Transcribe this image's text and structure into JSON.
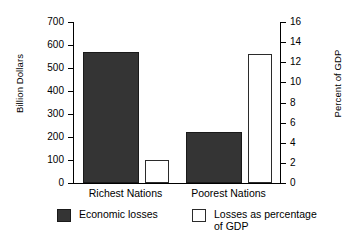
{
  "chart_data": {
    "type": "bar",
    "title": "",
    "categories": [
      "Richest Nations",
      "Poorest Nations"
    ],
    "series": [
      {
        "name": "Economic losses",
        "axis": "left",
        "unit": "Billion Dollars",
        "values": [
          570,
          220
        ],
        "color": "#343434",
        "fill": "solid"
      },
      {
        "name": "Losses as percentage\nof GDP",
        "axis": "right",
        "unit": "Percent of GDP",
        "values": [
          2.3,
          12.8
        ],
        "color": "#ffffff",
        "fill": "outline"
      }
    ],
    "xlabel": "",
    "ylabel": "Billion Dollars",
    "y2label": "Percent of GDP",
    "ylim": [
      0,
      700
    ],
    "y2lim": [
      0,
      16
    ],
    "yticks": [
      "0",
      "100",
      "200",
      "300",
      "400",
      "500",
      "600",
      "700"
    ],
    "y2ticks": [
      "0",
      "2",
      "4",
      "6",
      "8",
      "10",
      "12",
      "14",
      "16"
    ],
    "grid": false,
    "legend_position": "bottom"
  },
  "axes": {
    "left_title": "Billion Dollars",
    "right_title": "Percent of GDP"
  },
  "legend": {
    "items": [
      {
        "label": "Economic losses"
      },
      {
        "label": "Losses as percentage\nof GDP"
      }
    ]
  }
}
